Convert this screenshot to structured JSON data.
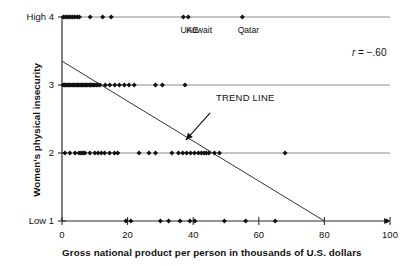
{
  "chart_data": {
    "type": "scatter",
    "title": "",
    "xlabel": "Gross national product per person in thousands of U.S. dollars",
    "ylabel": "Women's physical insecurity",
    "xlim": [
      0,
      100
    ],
    "ylim": [
      1,
      4
    ],
    "grid": "horizontal gridlines at each y level",
    "legend": "none",
    "xticks": [
      0,
      20,
      40,
      60,
      80,
      100
    ],
    "xticklabels": [
      "0",
      "20",
      "40",
      "60",
      "80",
      "100"
    ],
    "yticks": [
      1,
      2,
      3,
      4
    ],
    "yticklabels": [
      "Low 1",
      "2",
      "3",
      "High 4"
    ],
    "correlation_label": "r = -.60",
    "correlation": -0.6,
    "annotations": [
      {
        "text": "TREND LINE",
        "x": 47,
        "y": 2.65,
        "arrow_to_x": 42,
        "arrow_to_y": 2.1
      }
    ],
    "point_labels": [
      {
        "text": "UAE",
        "x": 37,
        "y": 4
      },
      {
        "text": "Kuwait",
        "x": 40,
        "y": 4
      },
      {
        "text": "Qatar",
        "x": 55,
        "y": 4
      }
    ],
    "trend_line": {
      "x0": 0,
      "y0": 3.35,
      "x1": 80,
      "y1": 1.0
    },
    "series": [
      {
        "name": "Countries",
        "marker": "diamond",
        "color": "#111111",
        "points": [
          [
            0.4,
            4
          ],
          [
            1.0,
            4
          ],
          [
            1.5,
            4
          ],
          [
            2.1,
            4
          ],
          [
            2.7,
            4
          ],
          [
            3.3,
            4
          ],
          [
            3.9,
            4
          ],
          [
            4.6,
            4
          ],
          [
            5.3,
            4
          ],
          [
            8.6,
            4
          ],
          [
            12.4,
            4
          ],
          [
            15.0,
            4
          ],
          [
            37.0,
            4
          ],
          [
            38.5,
            4
          ],
          [
            55.0,
            4
          ],
          [
            0.3,
            3
          ],
          [
            0.7,
            3
          ],
          [
            1.1,
            3
          ],
          [
            1.5,
            3
          ],
          [
            1.9,
            3
          ],
          [
            2.3,
            3
          ],
          [
            2.7,
            3
          ],
          [
            3.1,
            3
          ],
          [
            3.5,
            3
          ],
          [
            3.9,
            3
          ],
          [
            4.3,
            3
          ],
          [
            4.7,
            3
          ],
          [
            5.1,
            3
          ],
          [
            5.5,
            3
          ],
          [
            5.9,
            3
          ],
          [
            6.3,
            3
          ],
          [
            6.7,
            3
          ],
          [
            7.1,
            3
          ],
          [
            7.5,
            3
          ],
          [
            7.9,
            3
          ],
          [
            8.3,
            3
          ],
          [
            8.7,
            3
          ],
          [
            9.1,
            3
          ],
          [
            9.5,
            3
          ],
          [
            10.0,
            3
          ],
          [
            10.5,
            3
          ],
          [
            11.0,
            3
          ],
          [
            11.6,
            3
          ],
          [
            13.2,
            3
          ],
          [
            14.6,
            3
          ],
          [
            16.1,
            3
          ],
          [
            17.5,
            3
          ],
          [
            19.0,
            3
          ],
          [
            20.4,
            3
          ],
          [
            22.0,
            3
          ],
          [
            28.5,
            3
          ],
          [
            30.6,
            3
          ],
          [
            37.5,
            3
          ],
          [
            0.9,
            2
          ],
          [
            2.4,
            2
          ],
          [
            4.0,
            2
          ],
          [
            5.2,
            2
          ],
          [
            5.8,
            2
          ],
          [
            6.4,
            2
          ],
          [
            7.0,
            2
          ],
          [
            8.5,
            2
          ],
          [
            10.0,
            2
          ],
          [
            11.0,
            2
          ],
          [
            12.0,
            2
          ],
          [
            13.0,
            2
          ],
          [
            14.5,
            2
          ],
          [
            16.0,
            2
          ],
          [
            17.0,
            2
          ],
          [
            23.5,
            2
          ],
          [
            26.5,
            2
          ],
          [
            28.5,
            2
          ],
          [
            33.5,
            2
          ],
          [
            35.5,
            2
          ],
          [
            36.8,
            2
          ],
          [
            38.0,
            2
          ],
          [
            39.2,
            2
          ],
          [
            40.4,
            2
          ],
          [
            41.6,
            2
          ],
          [
            42.5,
            2
          ],
          [
            43.3,
            2
          ],
          [
            44.0,
            2
          ],
          [
            44.8,
            2
          ],
          [
            46.5,
            2
          ],
          [
            48.0,
            2
          ],
          [
            68.0,
            2
          ],
          [
            19.5,
            1
          ],
          [
            21.0,
            1
          ],
          [
            30.0,
            1
          ],
          [
            32.5,
            1
          ],
          [
            36.0,
            1
          ],
          [
            39.0,
            1
          ],
          [
            40.5,
            1
          ],
          [
            49.5,
            1
          ],
          [
            56.0,
            1
          ],
          [
            65.0,
            1
          ],
          [
            99.0,
            1
          ]
        ]
      }
    ]
  },
  "axis": {
    "y_title": "Women's physical insecurity",
    "x_title": "Gross national product per person in thousands of U.S. dollars"
  },
  "stats": {
    "r_prefix": "r",
    "r_rest": " = −.60"
  },
  "labels": {
    "trend_line": "TREND LINE"
  }
}
